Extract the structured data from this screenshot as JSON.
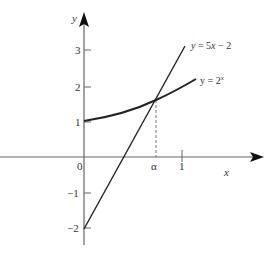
{
  "diagram": {
    "type": "function-graph",
    "axes": {
      "x_label": "x",
      "y_label": "y",
      "origin_label": "0",
      "x_ticks": [
        {
          "label": "α",
          "value": 0.735
        },
        {
          "label": "1",
          "value": 1
        }
      ],
      "y_ticks": [
        {
          "label": "3",
          "value": 3
        },
        {
          "label": "2",
          "value": 2
        },
        {
          "label": "1",
          "value": 1
        },
        {
          "label": "−1",
          "value": -1
        },
        {
          "label": "−2",
          "value": -2
        }
      ]
    },
    "curves": [
      {
        "name": "line",
        "label_prefix": "y = 5",
        "label_var": "x",
        "label_suffix": " − 2",
        "equation": "y = 5x - 2",
        "x_range": [
          0,
          1
        ]
      },
      {
        "name": "exponential",
        "label_prefix": "y = 2",
        "label_sup": "x",
        "equation": "y = 2^x",
        "x_range": [
          0,
          1.13
        ]
      }
    ],
    "intersection": {
      "label": "α",
      "x": 0.735,
      "y": 1.66
    },
    "colors": {
      "axis": "#666666",
      "curve": "#222222",
      "dashed": "#777777"
    }
  }
}
